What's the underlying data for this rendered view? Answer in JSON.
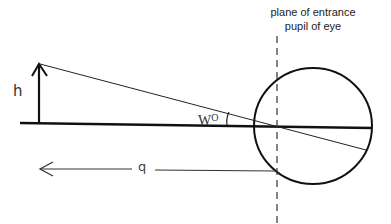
{
  "diagram": {
    "title_line1": "plane of entrance",
    "title_line2": "pupil of eye",
    "labels": {
      "height": "h",
      "angle": "W",
      "angle_unit": "O",
      "distance": "q"
    },
    "elements": [
      "object-arrow (height h)",
      "optical-axis",
      "chief-ray",
      "angle-arc W°",
      "eye-circle",
      "entrance-pupil-plane (dashed)",
      "distance-arrow q"
    ],
    "colors": {
      "stroke": "#111111",
      "text": "#222222",
      "background": "#ffffff"
    }
  }
}
